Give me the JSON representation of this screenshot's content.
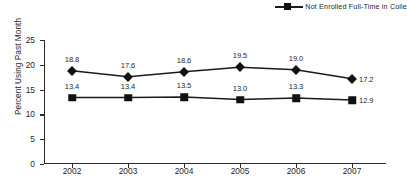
{
  "legend": {
    "entries": [
      {
        "label": "Not Enrolled Full-Time in Colle",
        "marker": "square-marker-icon"
      }
    ]
  },
  "axes": {
    "ylabel": "Percent Using Past Month",
    "yticks": [
      "0",
      "5",
      "10",
      "15",
      "20",
      "25"
    ],
    "xticks": [
      "2002",
      "2003",
      "2004",
      "2005",
      "2006",
      "2007"
    ]
  },
  "chart_data": {
    "type": "line",
    "title": "",
    "xlabel": "",
    "ylabel": "Percent Using Past Month",
    "categories": [
      "2002",
      "2003",
      "2004",
      "2005",
      "2006",
      "2007"
    ],
    "ylim": [
      0,
      25
    ],
    "ytick_step": 5,
    "grid": false,
    "legend_position": "top-right",
    "series": [
      {
        "name": "Enrolled Full-Time in College",
        "marker": "diamond",
        "values": [
          18.8,
          17.6,
          18.6,
          19.5,
          19.0,
          17.2
        ],
        "labels": [
          "18.8",
          "17.6",
          "18.6",
          "19.5",
          "19.0",
          "17.2"
        ],
        "label_positions": [
          "above",
          "above",
          "above",
          "above",
          "above",
          "right"
        ]
      },
      {
        "name": "Not Enrolled Full-Time in Colle",
        "marker": "square",
        "values": [
          13.4,
          13.4,
          13.5,
          13.0,
          13.3,
          12.9
        ],
        "labels": [
          "13.4",
          "13.4",
          "13.5",
          "13.0",
          "13.3",
          "12.9"
        ],
        "label_positions": [
          "above",
          "above",
          "above",
          "above",
          "above",
          "right"
        ]
      }
    ],
    "colors": {
      "line": "#1a1a1a",
      "marker": "#111111",
      "axis": "#2a2a2a",
      "text": "#1f1f1f",
      "background": "#ffffff"
    }
  }
}
